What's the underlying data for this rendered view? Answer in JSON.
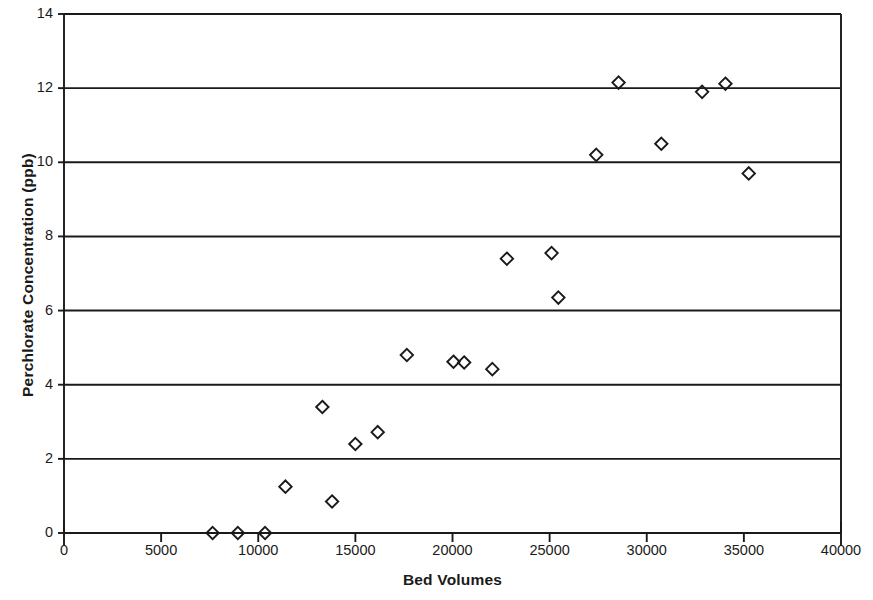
{
  "chart_data": {
    "type": "scatter",
    "title": "",
    "xlabel": "Bed Volumes",
    "ylabel": "Perchlorate Concentration (ppb)",
    "xlim": [
      0,
      40000
    ],
    "ylim": [
      0,
      14
    ],
    "xticks": [
      0,
      5000,
      10000,
      15000,
      20000,
      25000,
      30000,
      35000,
      40000
    ],
    "xtick_labels": [
      "0",
      "5000",
      "10000",
      "15000",
      "20000",
      "25000",
      "30000",
      "35000",
      "40000"
    ],
    "yticks": [
      0,
      2,
      4,
      6,
      8,
      10,
      12,
      14
    ],
    "ytick_labels": [
      "0",
      "2",
      "4",
      "6",
      "8",
      "10",
      "12",
      "14"
    ],
    "grid": "horizontal",
    "legend": "none",
    "marker": "open-diamond",
    "marker_color": "#1a1a1a",
    "series": [
      {
        "name": "Perchlorate Concentration",
        "points": [
          {
            "x": 7650,
            "y": 0.0
          },
          {
            "x": 8950,
            "y": 0.0
          },
          {
            "x": 10350,
            "y": 0.0
          },
          {
            "x": 11400,
            "y": 1.25
          },
          {
            "x": 13300,
            "y": 3.4
          },
          {
            "x": 13800,
            "y": 0.85
          },
          {
            "x": 15000,
            "y": 2.4
          },
          {
            "x": 16150,
            "y": 2.72
          },
          {
            "x": 17650,
            "y": 4.8
          },
          {
            "x": 20050,
            "y": 4.62
          },
          {
            "x": 20600,
            "y": 4.6
          },
          {
            "x": 22050,
            "y": 4.42
          },
          {
            "x": 22800,
            "y": 7.4
          },
          {
            "x": 25100,
            "y": 7.55
          },
          {
            "x": 25450,
            "y": 6.35
          },
          {
            "x": 27400,
            "y": 10.2
          },
          {
            "x": 28550,
            "y": 12.15
          },
          {
            "x": 30750,
            "y": 10.5
          },
          {
            "x": 32850,
            "y": 11.9
          },
          {
            "x": 34050,
            "y": 12.12
          },
          {
            "x": 35250,
            "y": 9.7
          }
        ]
      }
    ]
  },
  "geometry": {
    "plot_left": 64,
    "plot_right": 841,
    "plot_top": 14,
    "plot_bottom": 533
  },
  "colors": {
    "axis": "#1a1a1a",
    "grid": "#1a1a1a",
    "background": "#ffffff"
  }
}
